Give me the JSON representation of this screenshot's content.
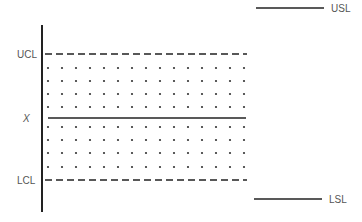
{
  "diagram": {
    "labels": {
      "ucl": "UCL",
      "center": "X",
      "lcl": "LCL",
      "usl": "USL",
      "lsl": "LSL"
    },
    "colors": {
      "line": "#222222",
      "text": "#555555",
      "dot": "#333333"
    },
    "dot_grid": {
      "columns": 15,
      "rows_above_center": 4,
      "rows_below_center": 4
    }
  }
}
